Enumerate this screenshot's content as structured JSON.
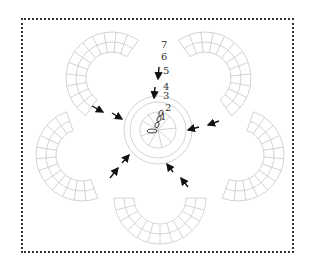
{
  "diagram": {
    "type": "crochet-flower-chart",
    "row_labels": [
      "7",
      "6",
      "5",
      "4",
      "3",
      "2",
      "1"
    ],
    "colors": {
      "stitches": "#c8c8c8",
      "arrows": "#111111",
      "border": "#333333"
    }
  }
}
